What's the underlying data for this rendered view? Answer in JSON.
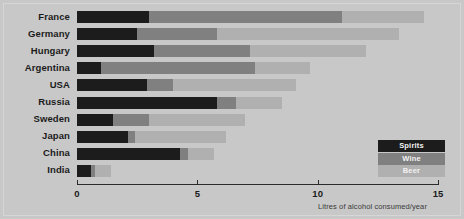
{
  "chart_data": {
    "type": "bar",
    "subtype": "horizontal-stacked",
    "title": "",
    "xlabel": "Litres of alcohol consumed/year",
    "ylabel": "",
    "xlim": [
      0,
      15
    ],
    "xticks": [
      0,
      5,
      10,
      15
    ],
    "xtick_labels": [
      "0",
      "5",
      "10",
      "15"
    ],
    "grid": false,
    "legend_position": "bottom-right",
    "categories": [
      "France",
      "Germany",
      "Hungary",
      "Argentina",
      "USA",
      "Russia",
      "Sweden",
      "Japan",
      "China",
      "India"
    ],
    "series": [
      {
        "name": "Spirits",
        "color": "#1c1c1c",
        "values": [
          3.0,
          2.5,
          3.2,
          1.0,
          2.9,
          5.8,
          1.5,
          2.1,
          4.3,
          0.6
        ]
      },
      {
        "name": "Wine",
        "color": "#808080",
        "values": [
          8.0,
          3.3,
          4.0,
          6.4,
          1.1,
          0.8,
          1.5,
          0.3,
          0.3,
          0.15
        ]
      },
      {
        "name": "Beer",
        "color": "#b0b0b0",
        "values": [
          3.4,
          7.6,
          4.8,
          2.3,
          5.1,
          1.9,
          4.0,
          3.8,
          1.1,
          0.65
        ]
      }
    ],
    "totals": [
      14.4,
      13.4,
      12.0,
      9.7,
      9.1,
      8.5,
      7.0,
      6.2,
      5.7,
      1.4
    ]
  },
  "legend": {
    "items": [
      {
        "label": "Spirits",
        "color": "#1c1c1c"
      },
      {
        "label": "Wine",
        "color": "#808080"
      },
      {
        "label": "Beer",
        "color": "#b0b0b0"
      }
    ]
  },
  "axis": {
    "title": "Litres of alcohol consumed/year",
    "ticks": [
      "0",
      "5",
      "10",
      "15"
    ]
  }
}
